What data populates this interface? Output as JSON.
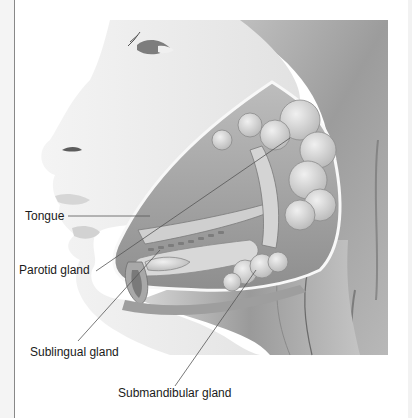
{
  "diagram": {
    "labels": [
      {
        "id": "tongue",
        "text": "Tongue"
      },
      {
        "id": "parotid",
        "text": "Parotid gland"
      },
      {
        "id": "sublingual",
        "text": "Sublingual gland"
      },
      {
        "id": "submandibular",
        "text": "Submandibular gland"
      }
    ],
    "colors": {
      "background": "#ffffff",
      "skin": "#efefef",
      "hair": "#9a9a9a",
      "gland": "#dcdcdc",
      "tissue_dark": "#8a8a8a",
      "leader_line": "#555555",
      "text": "#1a1a1a"
    }
  }
}
